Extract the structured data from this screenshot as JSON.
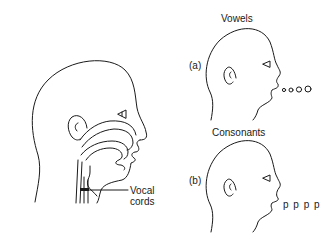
{
  "figure": {
    "main_head": {
      "description": "Cross-section of human head showing vocal tract",
      "callout_label_line1": "Vocal",
      "callout_label_line2": "cords"
    },
    "panels": [
      {
        "id": "a",
        "marker": "(a)",
        "title": "Vowels",
        "emission_symbols": "o o O O"
      },
      {
        "id": "b",
        "marker": "(b)",
        "title": "Consonants",
        "emission_symbols": "p p p p"
      }
    ]
  }
}
